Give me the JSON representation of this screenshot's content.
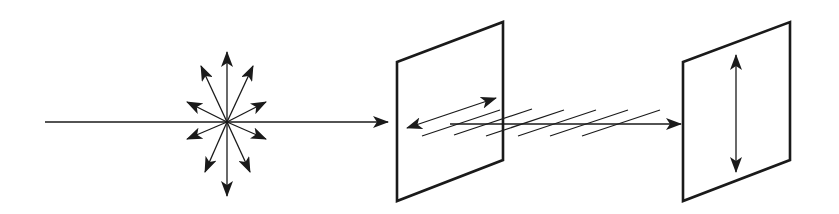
{
  "diagram": {
    "title": "Polarization of light by a polarizer",
    "colors": {
      "stroke": "#1a1a1a",
      "background": "#ffffff"
    },
    "elements": {
      "unpolarized_source": {
        "label": "unpolarized light",
        "center": [
          227,
          122
        ],
        "arrow_count": 10
      },
      "incident_ray": {
        "label": "incident beam",
        "from": [
          45,
          122
        ],
        "to": [
          388,
          122
        ]
      },
      "polarizer_1": {
        "label": "polarizer",
        "orientation": "horizontal (diagonal in perspective)"
      },
      "polarized_beam": {
        "label": "plane-polarized light",
        "to": [
          681,
          124
        ]
      },
      "polarizer_2": {
        "label": "analyzer",
        "orientation": "vertical"
      }
    }
  }
}
